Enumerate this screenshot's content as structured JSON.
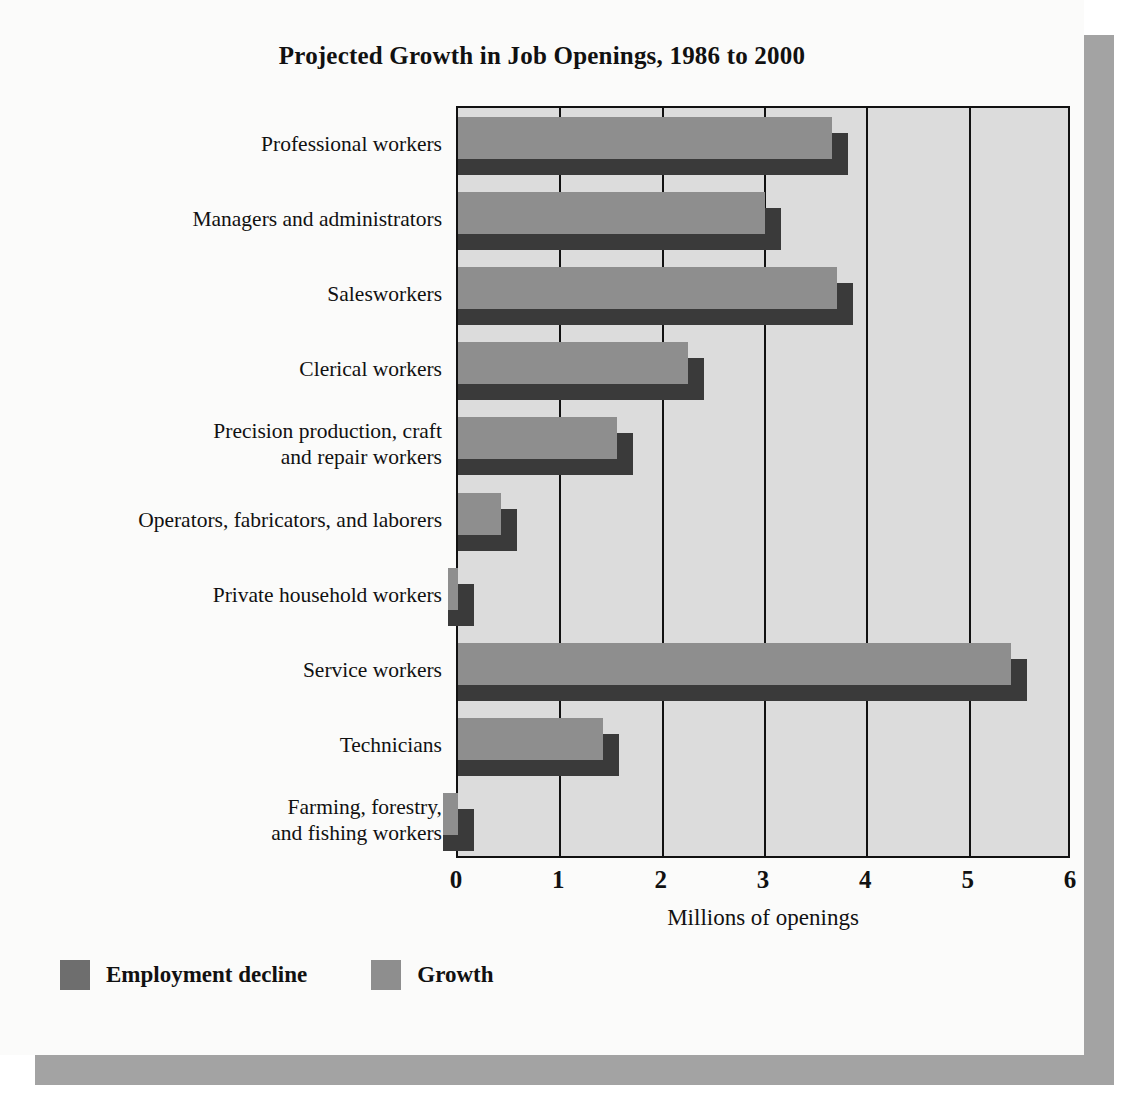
{
  "chart_data": {
    "type": "bar",
    "orientation": "horizontal",
    "title": "Projected Growth in Job Openings, 1986 to 2000",
    "xlabel": "Millions of openings",
    "ylabel": "",
    "xlim": [
      0,
      6
    ],
    "xticks": [
      "0",
      "1",
      "2",
      "3",
      "4",
      "5",
      "6"
    ],
    "grid": true,
    "legend_position": "bottom-left",
    "categories": [
      "Professional workers",
      "Managers and administrators",
      "Salesworkers",
      "Clerical workers",
      "Precision production, craft and repair workers",
      "Operators, fabricators, and laborers",
      "Private household workers",
      "Service workers",
      "Technicians",
      "Farming, forestry, and fishing workers"
    ],
    "category_lines": [
      [
        "Professional workers"
      ],
      [
        "Managers and administrators"
      ],
      [
        "Salesworkers"
      ],
      [
        "Clerical workers"
      ],
      [
        "Precision production, craft",
        "and repair workers"
      ],
      [
        "Operators, fabricators, and laborers"
      ],
      [
        "Private household workers"
      ],
      [
        "Service workers"
      ],
      [
        "Technicians"
      ],
      [
        "Farming, forestry,",
        "and fishing workers"
      ]
    ],
    "series": [
      {
        "name": "Growth",
        "color": "#8e8e8e",
        "values": [
          3.65,
          3.0,
          3.7,
          2.25,
          1.55,
          0.42,
          -0.1,
          5.4,
          1.42,
          -0.15
        ]
      }
    ],
    "legend": [
      {
        "label": "Employment decline",
        "color": "#6e6e6e"
      },
      {
        "label": "Growth",
        "color": "#8e8e8e"
      }
    ],
    "colors": {
      "bar_face": "#8e8e8e",
      "bar_depth": "#3a3a3a",
      "plot_background": "#dcdcdc",
      "page_background": "#fbfbfa",
      "axis": "#111111",
      "shadow": "#a3a3a3"
    }
  }
}
